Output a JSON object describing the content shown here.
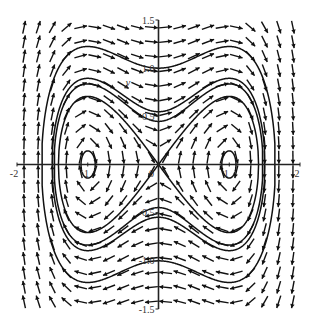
{
  "chart_data": {
    "type": "line",
    "title": "",
    "subtitle": "",
    "system": {
      "dx": "y",
      "dy": "x - x^3"
    },
    "xlabel": "x",
    "ylabel": "y",
    "xlim": [
      -2,
      2
    ],
    "ylim": [
      -1.5,
      1.5
    ],
    "grid": false,
    "legend": "none",
    "x_ticks": [
      {
        "value": -2,
        "label": "-2"
      },
      {
        "value": -1,
        "label": "-1"
      },
      {
        "value": 0,
        "label": "0"
      },
      {
        "value": 1,
        "label": "1"
      },
      {
        "value": 2,
        "label": "2"
      }
    ],
    "y_ticks": [
      {
        "value": 1.5,
        "label": "1.5"
      },
      {
        "value": 1.0,
        "label": "1.0"
      },
      {
        "value": 0.5,
        "label": "0.5"
      },
      {
        "value": -0.5,
        "label": "-0.5"
      },
      {
        "value": -1.0,
        "label": "-1.0"
      },
      {
        "value": -1.5,
        "label": "-1.5"
      }
    ],
    "direction_field": {
      "nx": 20,
      "ny": 20
    },
    "series": [
      {
        "name": "outer-orbit",
        "energy": 0.5,
        "y_at_x0": 1.0
      },
      {
        "name": "middle-orbit",
        "energy": 0.15,
        "y_at_x0": 0.55
      },
      {
        "name": "inner-orbit",
        "energy": 0.1,
        "y_at_x0": 0.45
      },
      {
        "name": "separatrix",
        "energy": 0.0,
        "y_at_x0": 0.0
      },
      {
        "name": "center-orbit-left",
        "energy": -0.24,
        "center": [
          -1,
          0
        ]
      },
      {
        "name": "center-orbit-right",
        "energy": -0.24,
        "center": [
          1,
          0
        ]
      }
    ],
    "colors": {
      "curve": "#111111",
      "arrow": "#111111",
      "axis": "#222222"
    }
  }
}
